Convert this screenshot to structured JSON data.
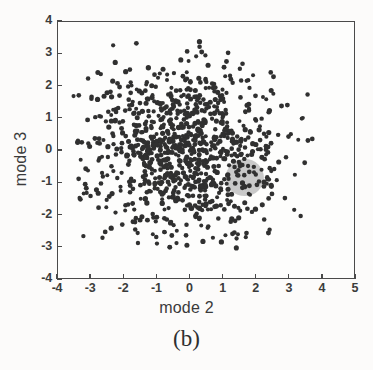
{
  "figure": {
    "caption": "(b)",
    "background_color": "#fcfbfa",
    "frame_color": "#4a4a4a"
  },
  "chart_data": {
    "type": "scatter",
    "title": "",
    "subtitle": "",
    "xlabel": "mode 2",
    "ylabel": "mode 3",
    "xlim": [
      -4,
      5
    ],
    "ylim": [
      -4,
      4
    ],
    "xticks": [
      -4,
      -3,
      -2,
      -1,
      0,
      1,
      2,
      3,
      4,
      5
    ],
    "yticks": [
      -4,
      -3,
      -2,
      -1,
      0,
      1,
      2,
      3,
      4
    ],
    "xtick_labels": [
      "-4",
      "-3",
      "-2",
      "-1",
      "0",
      "1",
      "2",
      "3",
      "4",
      "5"
    ],
    "ytick_labels": [
      "-4",
      "-3",
      "-2",
      "-1",
      "0",
      "1",
      "2",
      "3",
      "4"
    ],
    "grid": false,
    "legend": null,
    "legend_position": "none",
    "annotations": [
      {
        "name": "highlight-blob",
        "shape": "ellipse",
        "center": [
          1.68,
          -0.86
        ],
        "radius_x": 0.58,
        "radius_y": 0.58,
        "color": "#a9a9a9",
        "opacity": 0.62
      }
    ],
    "series": [
      {
        "name": "samples",
        "marker": "circle",
        "marker_size_px": 4.6,
        "color": "#303030",
        "n_points": 960,
        "distribution": "gaussian-cloud",
        "center": [
          -0.1,
          -0.05
        ],
        "sigma_x": 1.42,
        "sigma_y": 1.32,
        "x_range": [
          -3.62,
          3.85
        ],
        "y_range": [
          -3.22,
          3.52
        ]
      }
    ]
  }
}
